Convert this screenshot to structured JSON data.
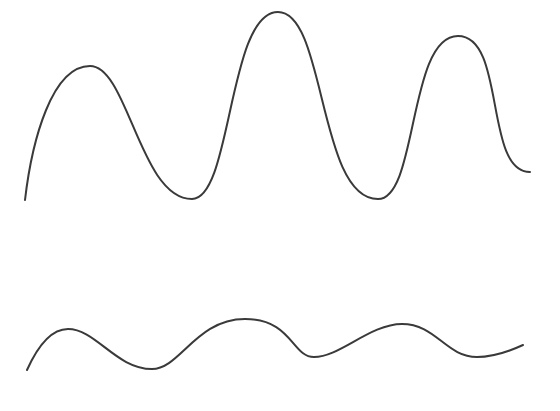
{
  "figure": {
    "background": "#ffffff",
    "stroke_color": "#3a3a3a",
    "stroke_width": 2
  },
  "curves": [
    {
      "name": "top-wave",
      "path": "M 25 200 C 32 140, 52 66, 90 66 C 128 66, 140 199, 192 199 C 232 199, 228 12, 278 12 C 326 12, 318 199, 378 199 C 418 199, 408 36, 458 36 C 506 36, 484 172, 530 172"
    },
    {
      "name": "bottom-wave",
      "path": "M 27 370 C 36 350, 50 329, 68 329 C 96 329, 116 369, 152 369 C 180 369, 196 319, 245 319 C 292 319, 292 357, 314 357 C 340 357, 370 324, 402 324 C 436 324, 446 357, 477 357 C 494 357, 510 351, 523 345"
    }
  ]
}
